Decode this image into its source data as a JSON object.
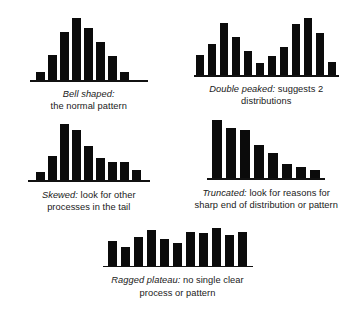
{
  "figure": {
    "background_color": "#ffffff",
    "bar_color": "#0b0b0b",
    "baseline_color": "#111111",
    "text_color": "#1a1a1a"
  },
  "chart_data": [
    {
      "id": "bell",
      "type": "bar",
      "title": "Bell shaped",
      "term": "Bell shaped:",
      "description": "the normal pattern",
      "caption_lines": [
        "Bell shaped:",
        "the normal pattern"
      ],
      "categories": [
        "1",
        "2",
        "3",
        "4",
        "5",
        "6",
        "7",
        "8",
        "9"
      ],
      "values": [
        8,
        25,
        48,
        62,
        52,
        38,
        24,
        8,
        0
      ],
      "xlabel": "",
      "ylabel": "",
      "ylim": [
        0,
        62
      ],
      "grid": false,
      "legend": "none",
      "bar_width_px": 9,
      "bar_gap_px": 3,
      "baseline_width_px": 118
    },
    {
      "id": "double-peaked",
      "type": "bar",
      "title": "Double peaked",
      "term": "Double peaked:",
      "description": "suggests 2 distributions",
      "caption_lines": [
        "Double peaked: suggests 2",
        "distributions"
      ],
      "categories": [
        "1",
        "2",
        "3",
        "4",
        "5",
        "6",
        "7",
        "8",
        "9",
        "10",
        "11",
        "12"
      ],
      "values": [
        20,
        31,
        52,
        38,
        24,
        12,
        19,
        28,
        51,
        57,
        42,
        13
      ],
      "xlabel": "",
      "ylabel": "",
      "ylim": [
        0,
        57
      ],
      "grid": false,
      "legend": "none",
      "bar_width_px": 8,
      "bar_gap_px": 4,
      "baseline_width_px": 145
    },
    {
      "id": "skewed",
      "type": "bar",
      "title": "Skewed",
      "term": "Skewed:",
      "description": "look for other processes in the tail",
      "caption_lines": [
        "Skewed: look for other",
        "processes in the tail"
      ],
      "categories": [
        "1",
        "2",
        "3",
        "4",
        "5",
        "6",
        "7",
        "8",
        "9"
      ],
      "values": [
        8,
        24,
        56,
        50,
        34,
        22,
        18,
        18,
        10
      ],
      "xlabel": "",
      "ylabel": "",
      "ylim": [
        0,
        56
      ],
      "grid": false,
      "legend": "none",
      "bar_width_px": 9,
      "bar_gap_px": 3,
      "baseline_width_px": 122
    },
    {
      "id": "truncated",
      "type": "bar",
      "title": "Truncated",
      "term": "Truncated:",
      "description": "look for reasons for sharp end of distribution or pattern",
      "caption_lines": [
        "Truncated: look for reasons for",
        "sharp end of distribution or pattern"
      ],
      "categories": [
        "1",
        "2",
        "3",
        "4",
        "5",
        "6",
        "7",
        "8"
      ],
      "values": [
        58,
        50,
        48,
        33,
        25,
        14,
        11,
        8
      ],
      "xlabel": "",
      "ylabel": "",
      "ylim": [
        0,
        58
      ],
      "grid": false,
      "legend": "none",
      "bar_width_px": 10,
      "bar_gap_px": 4,
      "baseline_width_px": 118
    },
    {
      "id": "ragged-plateau",
      "type": "bar",
      "title": "Ragged plateau",
      "term": "Ragged plateau:",
      "description": "no single clear process or pattern",
      "caption_lines": [
        "Ragged plateau: no single clear",
        "process or pattern"
      ],
      "categories": [
        "1",
        "2",
        "3",
        "4",
        "5",
        "6",
        "7",
        "8",
        "9",
        "10",
        "11"
      ],
      "values": [
        25,
        19,
        29,
        36,
        27,
        23,
        34,
        33,
        38,
        31,
        34
      ],
      "xlabel": "",
      "ylabel": "",
      "ylim": [
        0,
        38
      ],
      "grid": false,
      "legend": "none",
      "bar_width_px": 9,
      "bar_gap_px": 4,
      "baseline_width_px": 150
    }
  ]
}
